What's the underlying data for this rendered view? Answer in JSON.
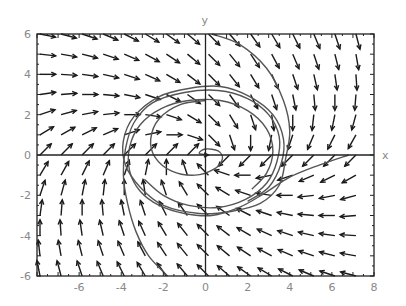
{
  "chart_data": {
    "type": "vector_field",
    "title": "",
    "xlabel": "x",
    "ylabel": "y",
    "xlim": [
      -8,
      8
    ],
    "ylim": [
      -6,
      6
    ],
    "xticks": [
      -6,
      -4,
      -2,
      0,
      2,
      4,
      6,
      8
    ],
    "yticks": [
      -6,
      -4,
      -2,
      0,
      2,
      4,
      6
    ],
    "xtick_labels": [
      "-6",
      "-4",
      "-2",
      "0",
      "2",
      "4",
      "6",
      "8"
    ],
    "ytick_labels": [
      "-6",
      "-4",
      "-2",
      "0",
      "2",
      "4",
      "6"
    ],
    "grid": false,
    "legend": null,
    "field": {
      "description": "direction field of linear system spiralling into origin",
      "dx": {
        "x": -1,
        "y": 2
      },
      "dy": {
        "x": -1,
        "y": -2
      },
      "arrow_grid_x": [
        -8,
        -7,
        -6,
        -5,
        -4,
        -3,
        -2,
        -1,
        0,
        1,
        2,
        3,
        4,
        5,
        6,
        7
      ],
      "arrow_grid_y": [
        -6,
        -5,
        -4,
        -3,
        -2,
        -1,
        0,
        1,
        2,
        3,
        4,
        5,
        6
      ],
      "arrow_length": 0.75
    },
    "trajectories": [
      {
        "name": "from-top",
        "points": [
          [
            0.3,
            6
          ],
          [
            1.6,
            5.5
          ],
          [
            2.9,
            4.3
          ],
          [
            3.7,
            2.7
          ],
          [
            4.0,
            1.2
          ],
          [
            3.8,
            -0.2
          ],
          [
            3.5,
            -1.5
          ],
          [
            2.6,
            -2.4
          ],
          [
            1.2,
            -2.8
          ],
          [
            -0.3,
            -2.9
          ],
          [
            -2.0,
            -2.5
          ],
          [
            -3.1,
            -1.6
          ],
          [
            -3.8,
            -0.5
          ],
          [
            -3.9,
            0.7
          ],
          [
            -3.4,
            1.9
          ],
          [
            -2.2,
            2.9
          ],
          [
            -0.8,
            3.3
          ],
          [
            0.7,
            3.4
          ],
          [
            2.1,
            2.9
          ],
          [
            3.2,
            2.0
          ],
          [
            3.7,
            0.8
          ],
          [
            3.6,
            -0.4
          ],
          [
            3.0,
            -1.6
          ],
          [
            2.0,
            -2.3
          ]
        ]
      },
      {
        "name": "from-bottom",
        "points": [
          [
            -1.8,
            -6
          ],
          [
            -2.7,
            -5.0
          ],
          [
            -3.3,
            -3.8
          ],
          [
            -3.7,
            -2.4
          ],
          [
            -3.9,
            -1.0
          ],
          [
            -3.8,
            0.3
          ],
          [
            -3.4,
            1.6
          ],
          [
            -2.5,
            2.6
          ],
          [
            -1.0,
            3.1
          ],
          [
            0.6,
            3.2
          ],
          [
            2.0,
            2.8
          ],
          [
            3.0,
            2.0
          ],
          [
            3.5,
            0.9
          ],
          [
            3.4,
            -0.3
          ],
          [
            2.9,
            -1.4
          ],
          [
            1.9,
            -2.2
          ],
          [
            0.6,
            -2.6
          ],
          [
            -0.8,
            -2.5
          ],
          [
            -2.0,
            -2.0
          ],
          [
            -2.9,
            -1.2
          ]
        ]
      },
      {
        "name": "from-right",
        "points": [
          [
            6.8,
            0
          ],
          [
            5.4,
            -0.5
          ],
          [
            4.0,
            -1.1
          ],
          [
            2.8,
            -1.9
          ],
          [
            1.6,
            -2.6
          ],
          [
            0.3,
            -3.0
          ],
          [
            -1.0,
            -2.9
          ],
          [
            -2.2,
            -2.5
          ],
          [
            -3.1,
            -1.8
          ],
          [
            -3.6,
            -0.8
          ],
          [
            -3.6,
            0.4
          ],
          [
            -3.1,
            1.5
          ],
          [
            -2.1,
            2.3
          ],
          [
            -0.8,
            2.7
          ],
          [
            0.7,
            2.7
          ],
          [
            2.0,
            2.2
          ],
          [
            2.9,
            1.3
          ],
          [
            3.2,
            0.2
          ],
          [
            2.9,
            -0.9
          ],
          [
            2.2,
            -1.7
          ]
        ]
      },
      {
        "name": "inner-spiral",
        "points": [
          [
            0.0,
            2.7
          ],
          [
            -1.2,
            2.5
          ],
          [
            -2.2,
            1.8
          ],
          [
            -2.6,
            0.8
          ],
          [
            -2.4,
            -0.1
          ],
          [
            -1.6,
            -0.8
          ],
          [
            -0.5,
            -1.0
          ],
          [
            0.4,
            -0.7
          ],
          [
            0.8,
            -0.2
          ],
          [
            0.6,
            0.2
          ],
          [
            0.0,
            0.3
          ],
          [
            -0.3,
            0.1
          ],
          [
            0.0,
            0.0
          ]
        ]
      }
    ]
  }
}
